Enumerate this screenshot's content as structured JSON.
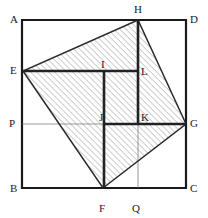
{
  "figure": {
    "type": "geometry-diagram",
    "canvas": {
      "width": 208,
      "height": 218,
      "background": "#ffffff"
    },
    "colors": {
      "outline": "#1a1a1a",
      "thick_line": "#222222",
      "thin_line": "#6e6e6e",
      "hatch": "#7d7d7d",
      "hatch_fill": "#ffffff",
      "label_text": "#1a1a1a"
    },
    "stroke_widths": {
      "square": 2.2,
      "quadrilateral": 1.6,
      "thick_inner": 2.6,
      "thin_inner": 0.7
    },
    "hatch": {
      "angle_deg": 45,
      "direction": "bottom-left-to-top-right",
      "spacing_px": 3,
      "stroke_width": 0.6
    },
    "points": {
      "A": {
        "x": 22,
        "y": 20,
        "label": "A",
        "label_x": 10,
        "label_y": 14,
        "on": "square-corner-top-left"
      },
      "D": {
        "x": 186,
        "y": 20,
        "label": "D",
        "label_x": 190,
        "label_y": 14,
        "on": "square-corner-top-right"
      },
      "B": {
        "x": 22,
        "y": 188,
        "label": "B",
        "label_x": 10,
        "label_y": 183,
        "on": "square-corner-bottom-left"
      },
      "C": {
        "x": 186,
        "y": 188,
        "label": "C",
        "label_x": 190,
        "label_y": 183,
        "on": "square-corner-bottom-right"
      },
      "E": {
        "x": 23,
        "y": 71,
        "label": "E",
        "label_x": 10,
        "label_y": 65,
        "on": "side-AB"
      },
      "F": {
        "x": 103,
        "y": 188,
        "label": "F",
        "label_x": 99,
        "label_y": 203,
        "on": "side-BC"
      },
      "G": {
        "x": 186,
        "y": 124,
        "label": "G",
        "label_x": 190,
        "label_y": 118,
        "on": "side-CD"
      },
      "H": {
        "x": 138,
        "y": 20,
        "label": "H",
        "label_x": 134,
        "label_y": 5,
        "on": "side-AD"
      },
      "I": {
        "x": 104,
        "y": 71,
        "label": "I",
        "label_x": 100,
        "label_y": 60,
        "on": "interior"
      },
      "L": {
        "x": 138,
        "y": 71,
        "label": "L",
        "label_x": 141,
        "label_y": 66,
        "on": "interior"
      },
      "J": {
        "x": 104,
        "y": 124,
        "label": "J",
        "label_x": 99,
        "label_y": 113,
        "on": "interior"
      },
      "K": {
        "x": 138,
        "y": 124,
        "label": "K",
        "label_x": 141,
        "label_y": 113,
        "on": "interior"
      },
      "P": {
        "x": 22,
        "y": 124,
        "label": "P",
        "label_x": 9,
        "label_y": 118,
        "on": "side-AB"
      },
      "Q": {
        "x": 138,
        "y": 188,
        "label": "Q",
        "label_x": 132,
        "label_y": 203,
        "on": "side-BC"
      }
    },
    "shapes": {
      "square": {
        "name": "ABCD",
        "vertices": [
          "A",
          "D",
          "C",
          "B"
        ]
      },
      "quadrilateral": {
        "name": "EFGH",
        "vertices": [
          "E",
          "F",
          "G",
          "H"
        ],
        "filled": true,
        "fill": "hatched"
      }
    },
    "segments": [
      {
        "name": "EL",
        "from": "E",
        "to": "L",
        "weight": "thick"
      },
      {
        "name": "JG",
        "from": "J",
        "to": "G",
        "weight": "thick"
      },
      {
        "name": "IF",
        "from": "I",
        "to": "F",
        "weight": "thick"
      },
      {
        "name": "HK",
        "from": "H",
        "to": "K",
        "weight": "thick"
      },
      {
        "name": "PG",
        "from": "P",
        "to": "G",
        "weight": "thin"
      },
      {
        "name": "KQ",
        "from": "K",
        "to": "Q",
        "weight": "thin"
      }
    ],
    "labels": [
      "A",
      "D",
      "B",
      "C",
      "E",
      "F",
      "G",
      "H",
      "I",
      "L",
      "J",
      "K",
      "P",
      "Q"
    ]
  }
}
